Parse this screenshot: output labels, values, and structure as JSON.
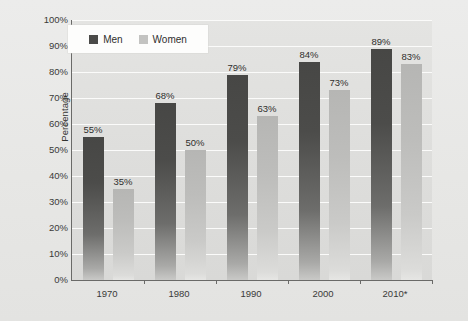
{
  "chart_data": {
    "type": "bar",
    "title": "",
    "subtitle": "",
    "xlabel": "",
    "ylabel": "Percentage",
    "categories": [
      "1970",
      "1980",
      "1990",
      "2000",
      "2010*"
    ],
    "series": [
      {
        "name": "Men",
        "color": "#4a4a48",
        "values": [
          55,
          68,
          79,
          84,
          89
        ],
        "labels": [
          "55%",
          "68%",
          "79%",
          "84%",
          "89%"
        ]
      },
      {
        "name": "Women",
        "color": "#c3c3c1",
        "values": [
          35,
          50,
          63,
          73,
          83
        ],
        "labels": [
          "35%",
          "50%",
          "63%",
          "73%",
          "83%"
        ]
      }
    ],
    "ylim": [
      0,
      100
    ],
    "ytick_values": [
      0,
      10,
      20,
      30,
      40,
      50,
      60,
      70,
      80,
      90,
      100
    ],
    "ytick_labels": [
      "0%",
      "10%",
      "20%",
      "30%",
      "40%",
      "50%",
      "60%",
      "70%",
      "80%",
      "90%",
      "100%"
    ],
    "grid": true,
    "grid_orientation": "horizontal",
    "grid_color": "#fbfbfa",
    "legend_position": "top-left-inside",
    "legend_entries": [
      "Men",
      "Women"
    ],
    "plot_background": "#e0e0de",
    "figure_background": "#e9e9e7",
    "axis_color": "#6a6a68",
    "data_label_format": "percent"
  },
  "legend": {
    "men_label": "Men",
    "women_label": "Women"
  },
  "axes": {
    "y_title": "Percentage"
  }
}
